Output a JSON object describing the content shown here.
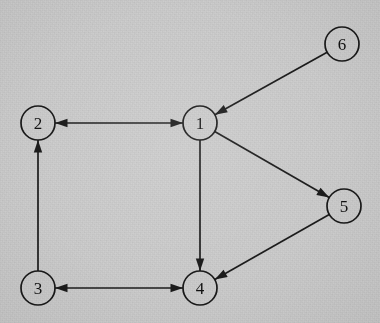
{
  "figure": {
    "kind": "directed-graph-diagram",
    "background_color": "#cdcdcd",
    "stroke_color": "#1b1b1b",
    "label_color": "#121212",
    "canvas": {
      "width": 380,
      "height": 323
    }
  },
  "graph": {
    "node_radius": 17,
    "nodes": [
      {
        "id": "1",
        "label": "1",
        "cx": 200,
        "cy": 123
      },
      {
        "id": "2",
        "label": "2",
        "cx": 38,
        "cy": 123
      },
      {
        "id": "3",
        "label": "3",
        "cx": 38,
        "cy": 288
      },
      {
        "id": "4",
        "label": "4",
        "cx": 200,
        "cy": 288
      },
      {
        "id": "5",
        "label": "5",
        "cx": 344,
        "cy": 206
      },
      {
        "id": "6",
        "label": "6",
        "cx": 342,
        "cy": 44
      }
    ],
    "edges": [
      {
        "id": "e-6-1",
        "from": "6",
        "to": "1",
        "direction": "one-way",
        "arrow_at": "to"
      },
      {
        "id": "e-1-2",
        "from": "1",
        "to": "2",
        "direction": "bidirectional",
        "arrow_at": "both"
      },
      {
        "id": "e-3-2",
        "from": "3",
        "to": "2",
        "direction": "one-way",
        "arrow_at": "to"
      },
      {
        "id": "e-3-4",
        "from": "3",
        "to": "4",
        "direction": "bidirectional",
        "arrow_at": "both"
      },
      {
        "id": "e-1-4",
        "from": "1",
        "to": "4",
        "direction": "one-way",
        "arrow_at": "to"
      },
      {
        "id": "e-1-5",
        "from": "1",
        "to": "5",
        "direction": "one-way",
        "arrow_at": "to"
      },
      {
        "id": "e-5-4",
        "from": "5",
        "to": "4",
        "direction": "one-way",
        "arrow_at": "to"
      }
    ]
  }
}
